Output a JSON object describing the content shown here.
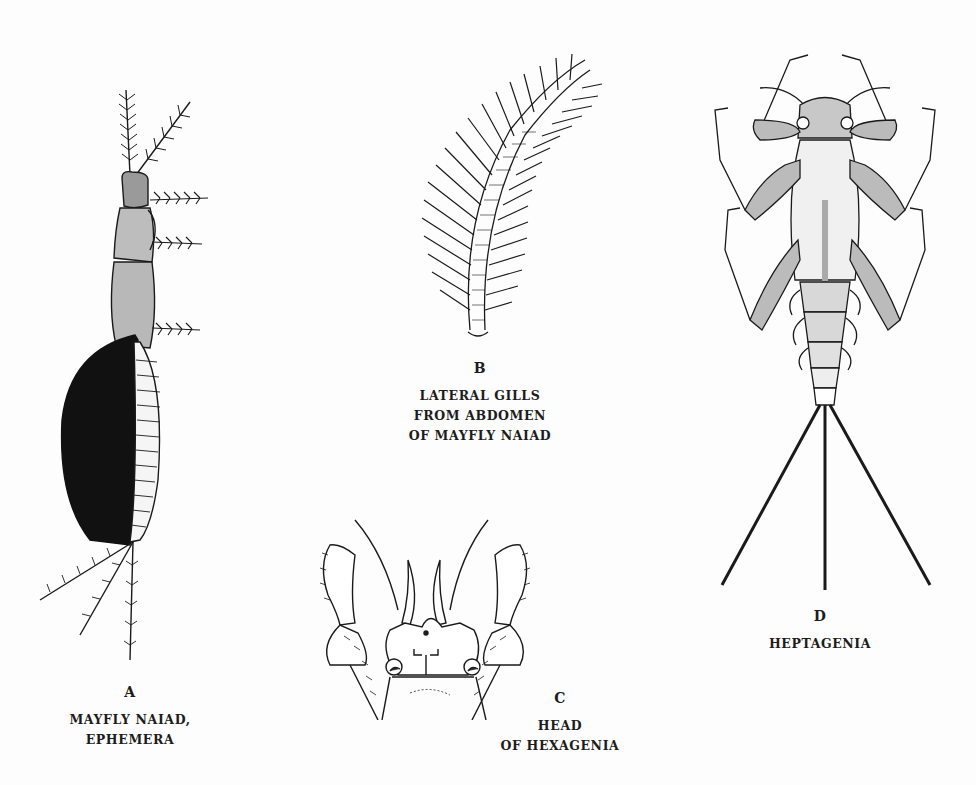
{
  "page": {
    "background": "#fdfdfd",
    "ink": "#1a1a1a"
  },
  "figures": [
    {
      "id": "A",
      "letter": "A",
      "caption_lines": [
        "MAYFLY NAIAD,",
        "EPHEMERA"
      ],
      "subject": "mayfly-naiad-ephemera-drawing"
    },
    {
      "id": "B",
      "letter": "B",
      "caption_lines": [
        "LATERAL GILLS",
        "FROM ABDOMEN",
        "OF MAYFLY NAIAD"
      ],
      "subject": "lateral-gill-drawing"
    },
    {
      "id": "C",
      "letter": "C",
      "caption_lines": [
        "HEAD",
        "OF HEXAGENIA"
      ],
      "subject": "hexagenia-head-drawing"
    },
    {
      "id": "D",
      "letter": "D",
      "caption_lines": [
        "HEPTAGENIA"
      ],
      "subject": "heptagenia-naiad-drawing"
    }
  ]
}
